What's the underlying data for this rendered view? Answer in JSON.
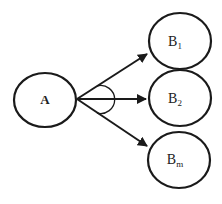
{
  "diagram": {
    "source_node": {
      "id": "A",
      "label": "A"
    },
    "target_nodes": [
      {
        "id": "B1",
        "label": "B",
        "subscript": "1"
      },
      {
        "id": "B2",
        "label": "B",
        "subscript": "2"
      },
      {
        "id": "Bm",
        "label": "B",
        "subscript": "m"
      }
    ],
    "edges": [
      {
        "from": "A",
        "to": "B1"
      },
      {
        "from": "A",
        "to": "B2"
      },
      {
        "from": "A",
        "to": "Bm"
      }
    ],
    "annotation": "angle arc spanning outgoing edges"
  }
}
